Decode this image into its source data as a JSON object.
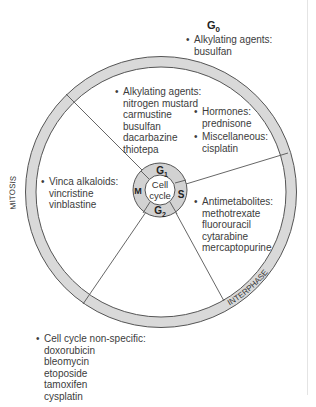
{
  "diagram": {
    "title": "Cell cycle",
    "center_label": [
      "Cell",
      "cycle"
    ],
    "phases": {
      "g1": "G",
      "g1_sub": "1",
      "s": "S",
      "g2": "G",
      "g2_sub": "2",
      "m": "M",
      "g0": "G",
      "g0_sub": "0"
    },
    "ring_labels": {
      "mitosis": "MITOSIS",
      "interphase": "INTERPHASE"
    },
    "colors": {
      "ring_fill": "#d9d9d9",
      "ring_stroke": "#555555",
      "line": "#555555",
      "text": "#3c3c3c"
    }
  },
  "groups": {
    "g0": {
      "heading": "Alkylating agents:",
      "drugs": [
        "busulfan"
      ]
    },
    "g1": {
      "heading": "Alkylating agents:",
      "drugs": [
        "nitrogen mustard",
        "carmustine",
        "busulfan",
        "dacarbazine",
        "thiotepa"
      ]
    },
    "hormones": {
      "heading": "Hormones:",
      "drugs": [
        "prednisone"
      ]
    },
    "misc": {
      "heading": "Miscellaneous:",
      "drugs": [
        "cisplatin"
      ]
    },
    "s": {
      "heading": "Antimetabolites:",
      "drugs": [
        "methotrexate",
        "fluorouracil",
        "cytarabine",
        "mercaptopurine"
      ]
    },
    "m": {
      "heading": "Vinca alkaloids:",
      "drugs": [
        "vincristine",
        "vinblastine"
      ]
    },
    "nonspecific": {
      "heading": "Cell cycle non-specific:",
      "drugs": [
        "doxorubicin",
        "bleomycin",
        "etoposide",
        "tamoxifen",
        "cysplatin"
      ]
    }
  },
  "bullet": "•"
}
